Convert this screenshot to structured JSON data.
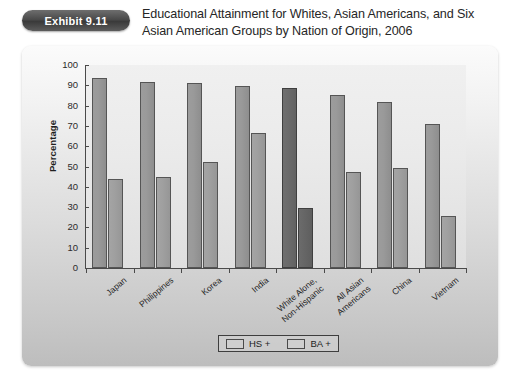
{
  "header": {
    "badge_label": "Exhibit 9.11",
    "title": "Educational Attainment for Whites, Asian Americans, and Six Asian American Groups by Nation of Origin, 2006"
  },
  "legend": {
    "items": [
      {
        "label": "HS +",
        "color": "#cfcfcf"
      },
      {
        "label": "BA +",
        "color": "#cfcfcf"
      }
    ]
  },
  "colors": {
    "bar_hs": "#9a9a9a",
    "bar_ba": "#a0a0a0",
    "bar_hs_highlight": "#6b6b6b",
    "bar_ba_highlight": "#666666",
    "panel_background": "#dcdcdc",
    "plot_background": "#eaeaea",
    "axis": "#4a4a4a",
    "badge": "#4a4a4a"
  },
  "chart_data": {
    "type": "bar",
    "title": "Educational Attainment for Whites, Asian Americans, and Six Asian American Groups by Nation of Origin, 2006",
    "xlabel": "",
    "ylabel": "Percentage",
    "ylim": [
      0,
      100
    ],
    "yticks": [
      0,
      10,
      20,
      30,
      40,
      50,
      60,
      70,
      80,
      90,
      100
    ],
    "grid": false,
    "legend_position": "bottom-center",
    "categories": [
      "Japan",
      "Philippines",
      "Korea",
      "India",
      "White Alone,\nNon-Hispanic",
      "All Asian\nAmericans",
      "China",
      "Vietnam"
    ],
    "series": [
      {
        "name": "HS +",
        "values": [
          93.5,
          91.5,
          91,
          89.5,
          88.5,
          85,
          82,
          71
        ]
      },
      {
        "name": "BA +",
        "values": [
          44,
          45,
          52,
          66.5,
          29.5,
          47.5,
          49.5,
          25.5
        ]
      }
    ],
    "highlight_category": "White Alone,\nNon-Hispanic"
  }
}
